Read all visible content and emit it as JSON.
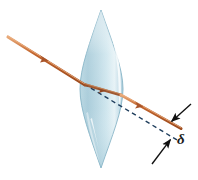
{
  "figure": {
    "type": "optics-ray-diagram",
    "canvas": {
      "width": 198,
      "height": 180
    },
    "background_color": "#ffffff"
  },
  "lens": {
    "name": "biconvex-converging-lens",
    "shape": "biconvex",
    "top_vertex": {
      "x": 101,
      "y": 10
    },
    "bottom_vertex": {
      "x": 101,
      "y": 168
    },
    "left_edge_x": 80,
    "right_edge_x": 123,
    "center": {
      "x": 101,
      "y": 89
    },
    "fill_top_color": "#cfe4ec",
    "fill_mid_color": "#a9ccda",
    "fill_bottom_color": "#bcd9e3",
    "outline_color": "#7fb0c4",
    "highlight_color": "#ffffff"
  },
  "rays": {
    "incident": {
      "name": "incident-ray",
      "color": "#c0622c",
      "highlight_color": "#e9a06a",
      "start": {
        "x": 8,
        "y": 37
      },
      "end": {
        "x": 84,
        "y": 84
      },
      "arrow_at": {
        "x": 44,
        "y": 59
      }
    },
    "internal": {
      "name": "refracted-ray-inside-lens",
      "color": "#a85a33",
      "start": {
        "x": 84,
        "y": 84
      },
      "end": {
        "x": 121,
        "y": 95
      }
    },
    "emergent": {
      "name": "emergent-ray",
      "color": "#c0622c",
      "highlight_color": "#e9a06a",
      "start": {
        "x": 121,
        "y": 95
      },
      "end": {
        "x": 180,
        "y": 128
      },
      "arrow_at": {
        "x": 140,
        "y": 106
      }
    },
    "undeviated": {
      "name": "undeviated-dashed-line",
      "color": "#1e3d5c",
      "style": "dashed",
      "start": {
        "x": 84,
        "y": 84
      },
      "end": {
        "x": 176,
        "y": 139
      }
    }
  },
  "displacement": {
    "name": "lateral-displacement-delta",
    "label": "δ",
    "upper_arrow": {
      "name": "upper-indicator-arrow",
      "tail": {
        "x": 190,
        "y": 105
      },
      "head": {
        "x": 170,
        "y": 122
      },
      "color": "#111111"
    },
    "lower_arrow": {
      "name": "lower-indicator-arrow",
      "tail": {
        "x": 153,
        "y": 163
      },
      "head": {
        "x": 170,
        "y": 139
      },
      "color": "#111111"
    },
    "label_position": {
      "x": 177,
      "y": 143
    },
    "label_color": "#1a1a1a"
  }
}
